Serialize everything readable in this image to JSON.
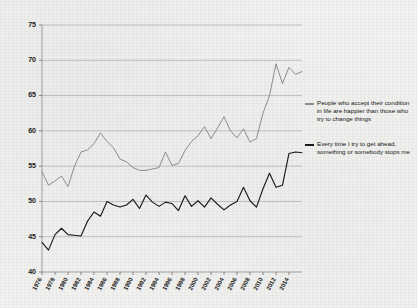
{
  "chart_data": {
    "type": "line",
    "title": "",
    "subtitle": "",
    "xlabel": "",
    "ylabel": "",
    "xlim": [
      1976,
      2016
    ],
    "ylim": [
      40,
      75
    ],
    "grid": true,
    "legend_position": "right",
    "y_ticks": [
      40,
      45,
      50,
      55,
      60,
      65,
      70,
      75
    ],
    "x_ticks": [
      1976,
      1978,
      1980,
      1982,
      1984,
      1986,
      1988,
      1990,
      1992,
      1994,
      1996,
      1998,
      2000,
      2002,
      2004,
      2006,
      2008,
      2010,
      2012,
      2014
    ],
    "x": [
      1976,
      1977,
      1978,
      1979,
      1980,
      1981,
      1982,
      1983,
      1984,
      1985,
      1986,
      1987,
      1988,
      1989,
      1990,
      1991,
      1992,
      1993,
      1994,
      1995,
      1996,
      1997,
      1998,
      1999,
      2000,
      2001,
      2002,
      2003,
      2004,
      2005,
      2006,
      2007,
      2008,
      2009,
      2010,
      2011,
      2012,
      2013,
      2014,
      2015,
      2016
    ],
    "series": [
      {
        "name": "People who accept their condition in life are happier than those who try to change things",
        "color": "#8c8c8c",
        "values": [
          54.2,
          52.3,
          52.9,
          53.6,
          52.1,
          55.0,
          57.0,
          57.3,
          58.2,
          59.7,
          58.5,
          57.6,
          56.0,
          55.6,
          54.8,
          54.4,
          54.4,
          54.6,
          54.8,
          57.0,
          55.1,
          55.4,
          57.2,
          58.5,
          59.3,
          60.6,
          58.9,
          60.4,
          62.0,
          60.0,
          59.0,
          60.3,
          58.4,
          58.9,
          62.5,
          65.0,
          69.5,
          66.7,
          69.0,
          68.0,
          68.4
        ]
      },
      {
        "name": "Every time I try to get ahead, something or somebody stops me",
        "color": "#1a1a1a",
        "values": [
          44.2,
          43.1,
          45.3,
          46.2,
          45.3,
          45.2,
          45.1,
          47.2,
          48.5,
          47.9,
          50.0,
          49.5,
          49.2,
          49.5,
          50.3,
          49.0,
          50.9,
          49.9,
          49.3,
          49.9,
          49.7,
          48.7,
          50.8,
          49.3,
          50.1,
          49.2,
          50.5,
          49.6,
          48.8,
          49.5,
          50.0,
          52.0,
          50.1,
          49.2,
          51.8,
          54.0,
          52.0,
          52.3,
          56.8,
          57.0,
          56.9
        ]
      }
    ]
  },
  "legend": {
    "entries": [
      {
        "label": "People who accept their condition in life are happier than those who try to change things",
        "color": "#8c8c8c"
      },
      {
        "label": "Every time I try to get ahead, something or somebody stops me",
        "color": "#1a1a1a"
      }
    ]
  }
}
